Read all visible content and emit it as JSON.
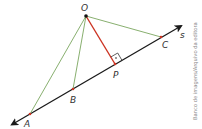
{
  "diagram": {
    "points": [
      {
        "name": "O",
        "x": 86,
        "y": 16,
        "lx": 81,
        "ly": 11
      },
      {
        "name": "A",
        "x": 30,
        "y": 114,
        "lx": 24,
        "ly": 127
      },
      {
        "name": "B",
        "x": 73,
        "y": 89,
        "lx": 70,
        "ly": 102
      },
      {
        "name": "P",
        "x": 115,
        "y": 64,
        "lx": 114,
        "ly": 77
      },
      {
        "name": "C",
        "x": 161,
        "y": 37,
        "lx": 162,
        "ly": 48
      }
    ],
    "line_label": {
      "name": "s",
      "x": 181,
      "y": 38
    },
    "colors": {
      "line": "#1a1a1a",
      "segments_green": "#6a9a4a",
      "perpendicular_red": "#cc3322",
      "point_marker": "#cc3322",
      "label": "#333333",
      "credit": "#888888"
    }
  },
  "credit": "Banco de imagens/Arquivo da editora"
}
